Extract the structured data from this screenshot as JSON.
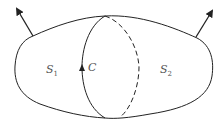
{
  "diagram": {
    "labels": {
      "s1": {
        "main": "S",
        "sub": "1"
      },
      "s2": {
        "main": "S",
        "sub": "2"
      },
      "curve": "C"
    },
    "colors": {
      "stroke": "#222222",
      "text": "#555555",
      "background": "#ffffff"
    }
  }
}
